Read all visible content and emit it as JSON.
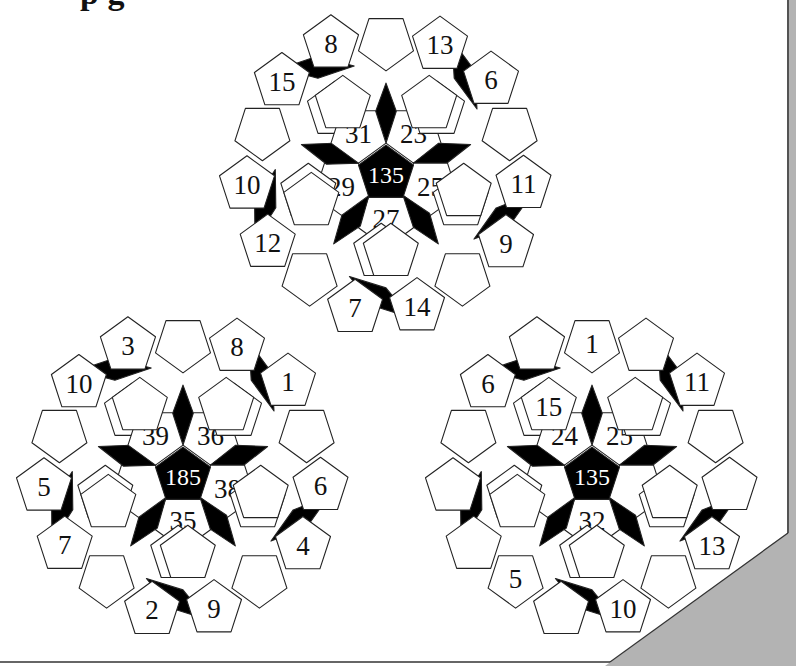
{
  "page": {
    "title_fragment": "p            g",
    "background": "#ffffff",
    "curl_color": "#b3b3b3",
    "edge_color": "#333333"
  },
  "puzzles": [
    {
      "name": "top-puzzle",
      "cx": 386,
      "cy": 172,
      "center_value": "135",
      "inner": [
        "23",
        "25",
        "27",
        "29",
        "31"
      ],
      "mid": [
        "",
        "",
        "",
        "",
        "",
        "",
        "",
        "",
        "",
        ""
      ],
      "outer": [
        "",
        "13",
        "6",
        "",
        "11",
        "9",
        "",
        "14",
        "7",
        "",
        "12",
        "10",
        "",
        "15",
        "8"
      ]
    },
    {
      "name": "bottom-left-puzzle",
      "cx": 183,
      "cy": 474,
      "center_value": "185",
      "inner": [
        "36",
        "38",
        "35",
        "",
        "39"
      ],
      "mid": [
        "",
        "",
        "",
        "",
        "",
        "",
        "",
        "",
        "",
        ""
      ],
      "outer": [
        "",
        "8",
        "1",
        "",
        "6",
        "4",
        "",
        "9",
        "2",
        "",
        "7",
        "5",
        "",
        "10",
        "3"
      ]
    },
    {
      "name": "bottom-right-puzzle",
      "cx": 592,
      "cy": 474,
      "center_value": "135",
      "inner": [
        "25",
        "",
        "32",
        "",
        "24"
      ],
      "mid": [
        "",
        "",
        "11",
        "",
        "",
        "",
        "",
        "",
        "15",
        ""
      ],
      "outer": [
        "1",
        "",
        "11",
        "",
        "",
        "13",
        "",
        "10",
        "",
        "5",
        "",
        "",
        "",
        "6",
        ""
      ]
    }
  ]
}
